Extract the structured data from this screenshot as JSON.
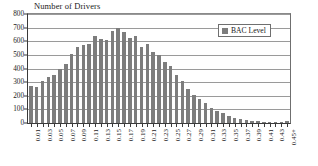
{
  "chart_data": {
    "type": "bar",
    "title": "Number of Drivers",
    "xlabel": "",
    "ylabel": "",
    "ylim": [
      0,
      800
    ],
    "ytick_step": 100,
    "yticks": [
      0,
      100,
      200,
      300,
      400,
      500,
      600,
      700,
      800
    ],
    "grid": true,
    "legend_position": "top-right",
    "legend": [
      "BAC Level"
    ],
    "series_color": "#7d7d7d",
    "categories": [
      "0.01",
      "0.02",
      "0.03",
      "0.04",
      "0.05",
      "0.06",
      "0.07",
      "0.08",
      "0.09",
      "0.10",
      "0.11",
      "0.12",
      "0.13",
      "0.14",
      "0.15",
      "0.16",
      "0.17",
      "0.18",
      "0.19",
      "0.20",
      "0.21",
      "0.22",
      "0.23",
      "0.24",
      "0.25",
      "0.26",
      "0.27",
      "0.28",
      "0.29",
      "0.30",
      "0.31",
      "0.32",
      "0.33",
      "0.34",
      "0.35",
      "0.36",
      "0.37",
      "0.38",
      "0.39",
      "0.40",
      "0.41",
      "0.42",
      "0.43",
      "0.44",
      "0.45+"
    ],
    "tick_labels_shown": [
      "0.01",
      "",
      "0.03",
      "",
      "0.05",
      "",
      "0.07",
      "",
      "0.09",
      "",
      "0.11",
      "",
      "0.13",
      "",
      "0.15",
      "",
      "0.17",
      "",
      "0.19",
      "",
      "0.21",
      "",
      "0.23",
      "",
      "0.25",
      "",
      "0.27",
      "",
      "0.29",
      "",
      "0.31",
      "",
      "0.33",
      "",
      "0.35",
      "",
      "0.37",
      "",
      "0.39",
      "",
      "0.41",
      "",
      "0.43",
      "",
      "0.45+"
    ],
    "series": [
      {
        "name": "BAC Level",
        "values": [
          275,
          265,
          310,
          340,
          355,
          395,
          435,
          510,
          555,
          570,
          578,
          635,
          620,
          612,
          678,
          695,
          665,
          625,
          635,
          560,
          578,
          520,
          500,
          450,
          420,
          355,
          310,
          250,
          205,
          175,
          150,
          110,
          85,
          70,
          52,
          40,
          30,
          22,
          16,
          12,
          9,
          7,
          6,
          5,
          18
        ]
      }
    ]
  }
}
